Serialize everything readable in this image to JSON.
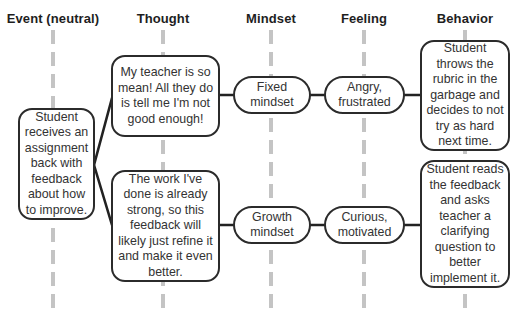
{
  "headers": {
    "event": "Event (neutral)",
    "thought": "Thought",
    "mindset": "Mindset",
    "feeling": "Feeling",
    "behavior": "Behavior"
  },
  "event": {
    "text": "Student receives an assignment back with feedback about how to improve."
  },
  "fixed_path": {
    "thought": "My teacher is so mean! All they do is tell me I'm not good enough!",
    "mindset": "Fixed mindset",
    "feeling": "Angry, frustrated",
    "behavior": "Student throws the rubric in the garbage and decides to not try as hard next time."
  },
  "growth_path": {
    "thought": "The work I've done is already strong, so this feedback will likely just refine it and make it even better.",
    "mindset": "Growth mindset",
    "feeling": "Curious, motivated",
    "behavior": "Student reads the feedback and asks teacher a clarifying question to better implement it."
  },
  "colors": {
    "border": "#2b2b2b",
    "guide": "#c4c4c4",
    "text": "#333333"
  }
}
